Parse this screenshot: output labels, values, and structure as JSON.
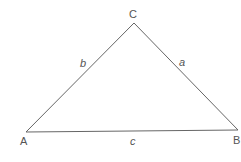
{
  "diagram": {
    "type": "triangle",
    "stroke_color": "#666666",
    "vertices": [
      {
        "label": "A",
        "x": 26,
        "y": 132
      },
      {
        "label": "B",
        "x": 238,
        "y": 130
      },
      {
        "label": "C",
        "x": 134,
        "y": 23
      }
    ],
    "sides": [
      {
        "label": "a",
        "between": "B-C"
      },
      {
        "label": "b",
        "between": "A-C"
      },
      {
        "label": "c",
        "between": "A-B"
      }
    ]
  }
}
